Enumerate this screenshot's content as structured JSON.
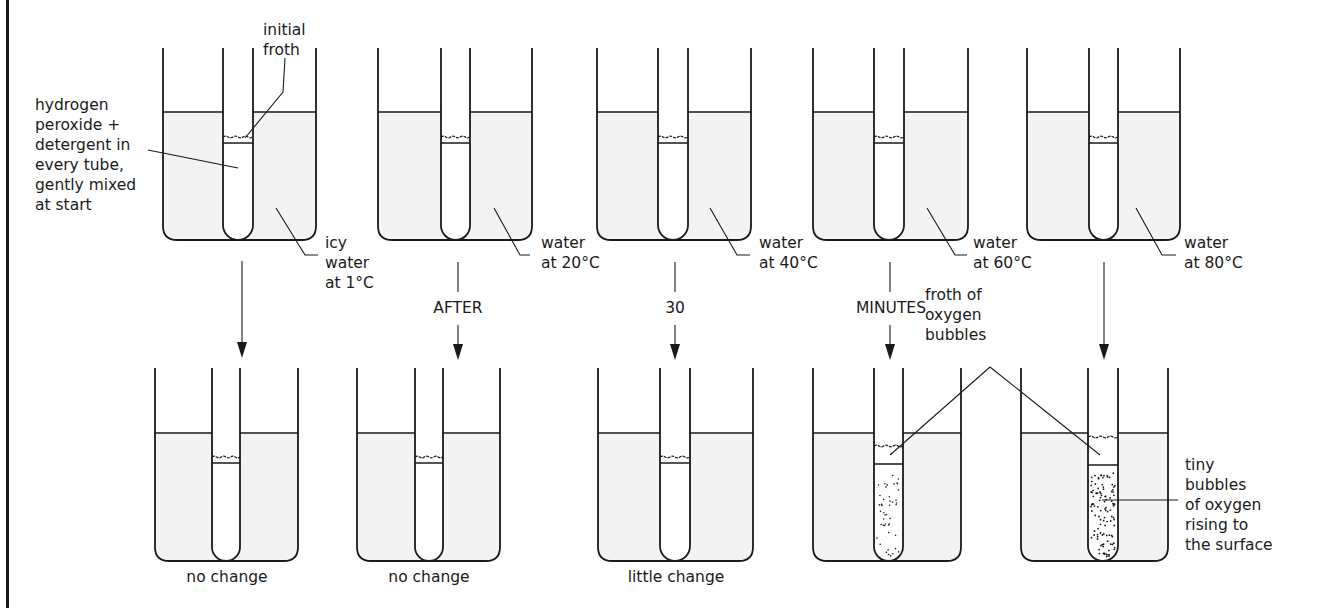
{
  "diagram": {
    "colors": {
      "line": "#1a1a1a",
      "water_fill": "#f3f3f3",
      "background": "#ffffff"
    },
    "annotations": {
      "reagent": "hydrogen\nperoxide +\ndetergent in\nevery tube,\ngently mixed\nat start",
      "initial_froth": "initial\nfroth",
      "froth_oxygen": "froth of\noxygen\nbubbles",
      "tiny_bubbles": "tiny\nbubbles\nof oxygen\nrising to\nthe surface"
    },
    "timeline": {
      "word1": "AFTER",
      "word2": "30",
      "word3": "MINUTES"
    },
    "columns": [
      {
        "water_label": "icy\nwater\nat 1°C",
        "result": "no change",
        "bubbles": "none"
      },
      {
        "water_label": "water\nat 20°C",
        "result": "no change",
        "bubbles": "none"
      },
      {
        "water_label": "water\nat 40°C",
        "result": "little change",
        "bubbles": "none"
      },
      {
        "water_label": "water\nat 60°C",
        "result": "",
        "bubbles": "some"
      },
      {
        "water_label": "water\nat 80°C",
        "result": "",
        "bubbles": "many"
      }
    ]
  }
}
